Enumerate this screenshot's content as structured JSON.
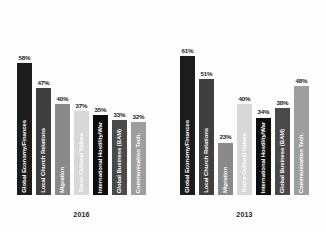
{
  "chart_data": [
    {
      "type": "bar",
      "title": "2016",
      "xlabel": "",
      "ylabel": "",
      "ylim": [
        0,
        65
      ],
      "grid": false,
      "legend": "none",
      "orientation": "vertical",
      "categories": [
        "Global Economy/Finances",
        "Local Church Relations",
        "Migration",
        "Socio-Cultural Values",
        "International Hostility/War",
        "Global Business (BAM)",
        "Communication Tech."
      ],
      "values": [
        58,
        47,
        40,
        37,
        35,
        33,
        32
      ],
      "value_labels": [
        "58%",
        "47%",
        "40%",
        "37%",
        "35%",
        "33%",
        "32%"
      ],
      "bar_colors": [
        "#1c1c1c",
        "#3f3f3f",
        "#8a8a8a",
        "#d8d8d8",
        "#0d0d0d",
        "#4a4a4a",
        "#9e9e9e"
      ],
      "label_colors": [
        "#ffffff",
        "#ffffff",
        "#ffffff",
        "#ffffff",
        "#ffffff",
        "#ffffff",
        "#ffffff"
      ]
    },
    {
      "type": "bar",
      "title": "2013",
      "xlabel": "",
      "ylabel": "",
      "ylim": [
        0,
        65
      ],
      "grid": false,
      "legend": "none",
      "orientation": "vertical",
      "categories": [
        "Global Economy/Finances",
        "Local Church Relations",
        "Migration",
        "Socio-Cultural Values",
        "International Hostility/War",
        "Global Business (BAM)",
        "Communication Tech."
      ],
      "values": [
        61,
        51,
        23,
        40,
        34,
        38,
        48
      ],
      "value_labels": [
        "61%",
        "51%",
        "23%",
        "40%",
        "34%",
        "38%",
        "48%"
      ],
      "bar_colors": [
        "#1c1c1c",
        "#3f3f3f",
        "#8a8a8a",
        "#d8d8d8",
        "#0d0d0d",
        "#4a4a4a",
        "#9e9e9e"
      ],
      "label_colors": [
        "#ffffff",
        "#ffffff",
        "#ffffff",
        "#ffffff",
        "#ffffff",
        "#ffffff",
        "#ffffff"
      ]
    }
  ]
}
